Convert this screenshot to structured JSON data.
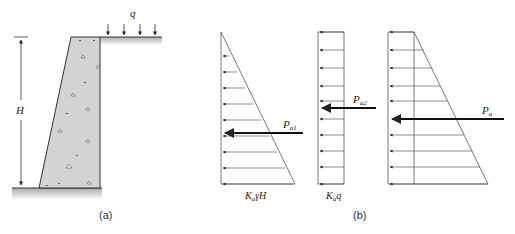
{
  "figure": {
    "panel_a": {
      "caption": "(a)",
      "height_label": "H",
      "surcharge_label": "q",
      "surcharge_arrow_count": 4
    },
    "panel_b": {
      "caption": "(b)",
      "triangle": {
        "resultant_label": "P",
        "resultant_sub": "a1",
        "base_label_main": "K",
        "base_label_sub": "a",
        "base_label_rest": "γH",
        "arrow_count": 9
      },
      "rectangle": {
        "resultant_label": "P",
        "resultant_sub": "a2",
        "base_label_main": "K",
        "base_label_sub": "a",
        "base_label_rest": "q",
        "arrow_count": 9
      },
      "trapezoid": {
        "resultant_label": "P",
        "resultant_sub": "a",
        "arrow_count": 10
      }
    },
    "colors": {
      "line": "#333333",
      "wall_fill": "#d8d8d8",
      "ground": "#bbbbbb"
    }
  }
}
